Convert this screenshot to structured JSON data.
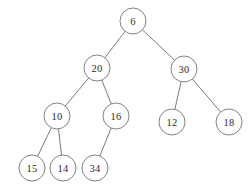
{
  "diagram": {
    "type": "binary-tree",
    "background_color": "#ffffff",
    "node_stroke_color": "#757575",
    "node_fill_color": "#ffffff",
    "edge_color": "#6b6b6b",
    "label_color": "#2b2b2b",
    "node_radius": 13,
    "canvas": {
      "width": 252,
      "height": 196
    }
  },
  "nodes": [
    {
      "id": "n6",
      "label": "6",
      "x": 133,
      "y": 21,
      "level": 0,
      "parent": null,
      "side": "root"
    },
    {
      "id": "n20",
      "label": "20",
      "x": 97,
      "y": 68,
      "level": 1,
      "parent": "n6",
      "side": "left"
    },
    {
      "id": "n30",
      "label": "30",
      "x": 184,
      "y": 69,
      "level": 1,
      "parent": "n6",
      "side": "right"
    },
    {
      "id": "n10",
      "label": "10",
      "x": 57,
      "y": 116,
      "level": 2,
      "parent": "n20",
      "side": "left"
    },
    {
      "id": "n16",
      "label": "16",
      "x": 116,
      "y": 116,
      "level": 2,
      "parent": "n20",
      "side": "right"
    },
    {
      "id": "n12",
      "label": "12",
      "x": 172,
      "y": 122,
      "level": 2,
      "parent": "n30",
      "side": "left"
    },
    {
      "id": "n18",
      "label": "18",
      "x": 229,
      "y": 122,
      "level": 2,
      "parent": "n30",
      "side": "right"
    },
    {
      "id": "n15",
      "label": "15",
      "x": 32,
      "y": 168,
      "level": 3,
      "parent": "n10",
      "side": "left"
    },
    {
      "id": "n14",
      "label": "14",
      "x": 63,
      "y": 168,
      "level": 3,
      "parent": "n10",
      "side": "right"
    },
    {
      "id": "n34",
      "label": "34",
      "x": 95,
      "y": 168,
      "level": 3,
      "parent": "n16",
      "side": "left"
    }
  ],
  "edges": [
    {
      "id": "e6-20",
      "from": "n6",
      "to": "n20"
    },
    {
      "id": "e6-30",
      "from": "n6",
      "to": "n30"
    },
    {
      "id": "e20-10",
      "from": "n20",
      "to": "n10"
    },
    {
      "id": "e20-16",
      "from": "n20",
      "to": "n16"
    },
    {
      "id": "e30-12",
      "from": "n30",
      "to": "n12"
    },
    {
      "id": "e30-18",
      "from": "n30",
      "to": "n18"
    },
    {
      "id": "e10-15",
      "from": "n10",
      "to": "n15"
    },
    {
      "id": "e10-14",
      "from": "n10",
      "to": "n14"
    },
    {
      "id": "e16-34",
      "from": "n16",
      "to": "n34"
    }
  ]
}
